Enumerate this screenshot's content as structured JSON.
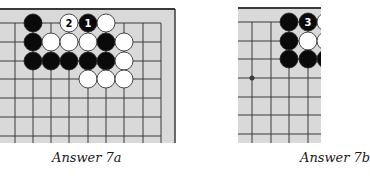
{
  "colors": {
    "board_bg": "#d9d9d9",
    "grid_line": "#3a3a3a",
    "black_stone": "#0a0a0a",
    "white_stone": "#ffffff",
    "stone_outline": "#222222"
  },
  "diagrams": [
    {
      "caption": "Answer 7a",
      "stones": [
        {
          "color": "black",
          "x": 33,
          "y": 23,
          "label": ""
        },
        {
          "color": "white",
          "x": 69,
          "y": 23,
          "label": "2"
        },
        {
          "color": "black",
          "x": 88,
          "y": 23,
          "label": "1"
        },
        {
          "color": "white",
          "x": 106,
          "y": 23,
          "label": ""
        },
        {
          "color": "black",
          "x": 33,
          "y": 42,
          "label": ""
        },
        {
          "color": "white",
          "x": 51,
          "y": 42,
          "label": ""
        },
        {
          "color": "white",
          "x": 69,
          "y": 42,
          "label": ""
        },
        {
          "color": "white",
          "x": 88,
          "y": 42,
          "label": ""
        },
        {
          "color": "black",
          "x": 106,
          "y": 42,
          "label": ""
        },
        {
          "color": "white",
          "x": 124,
          "y": 42,
          "label": ""
        },
        {
          "color": "black",
          "x": 33,
          "y": 61,
          "label": ""
        },
        {
          "color": "black",
          "x": 51,
          "y": 61,
          "label": ""
        },
        {
          "color": "black",
          "x": 69,
          "y": 61,
          "label": ""
        },
        {
          "color": "black",
          "x": 88,
          "y": 61,
          "label": ""
        },
        {
          "color": "black",
          "x": 106,
          "y": 61,
          "label": ""
        },
        {
          "color": "white",
          "x": 124,
          "y": 61,
          "label": ""
        },
        {
          "color": "white",
          "x": 88,
          "y": 79,
          "label": ""
        },
        {
          "color": "white",
          "x": 106,
          "y": 79,
          "label": ""
        },
        {
          "color": "white",
          "x": 124,
          "y": 79,
          "label": ""
        }
      ]
    },
    {
      "caption": "Answer 7b",
      "stones": [
        {
          "color": "black",
          "x": 289,
          "y": 22,
          "label": ""
        },
        {
          "color": "black",
          "x": 308,
          "y": 22,
          "label": "3"
        },
        {
          "color": "white",
          "x": 326,
          "y": 22,
          "label": ""
        },
        {
          "color": "black",
          "x": 289,
          "y": 41,
          "label": ""
        },
        {
          "color": "white",
          "x": 308,
          "y": 41,
          "label": ""
        },
        {
          "color": "white",
          "x": 326,
          "y": 41,
          "label": ""
        },
        {
          "color": "black",
          "x": 289,
          "y": 59,
          "label": ""
        },
        {
          "color": "black",
          "x": 308,
          "y": 59,
          "label": ""
        },
        {
          "color": "black",
          "x": 326,
          "y": 59,
          "label": ""
        }
      ],
      "star_points": [
        {
          "x": 252,
          "y": 78
        }
      ]
    }
  ]
}
